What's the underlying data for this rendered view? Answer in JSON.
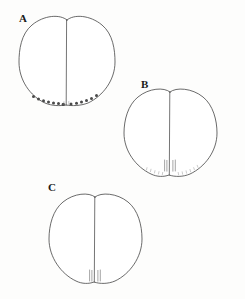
{
  "figure": {
    "background_color": "#fdfdfc",
    "line_color": "#3a3a3a",
    "dot_color": "#4a4a4a",
    "faint_color": "#9a9a9a",
    "width": 245,
    "height": 299,
    "panels": [
      {
        "id": "A",
        "label": "A",
        "label_x": 19,
        "label_y": 22,
        "center_x": 67,
        "center_y": 62,
        "radius_x": 48,
        "radius_y": 47,
        "top_notch_depth": 7,
        "midline_top_y": 20,
        "midline_bottom_y": 105,
        "feature_type": "dots",
        "feature_count": 13,
        "dots": [
          {
            "x": 33.5,
            "y": 96.5,
            "r": 1.5
          },
          {
            "x": 38.5,
            "y": 99.0,
            "r": 1.5
          },
          {
            "x": 43.5,
            "y": 100.5,
            "r": 1.5
          },
          {
            "x": 48.5,
            "y": 101.5,
            "r": 1.5
          },
          {
            "x": 53.5,
            "y": 102.5,
            "r": 1.5
          },
          {
            "x": 58.5,
            "y": 103.5,
            "r": 1.5
          },
          {
            "x": 63.5,
            "y": 104.5,
            "r": 1.7
          },
          {
            "x": 71.0,
            "y": 104.0,
            "r": 1.5
          },
          {
            "x": 76.5,
            "y": 103.0,
            "r": 1.5
          },
          {
            "x": 81.5,
            "y": 102.0,
            "r": 1.5
          },
          {
            "x": 86.5,
            "y": 100.5,
            "r": 1.5
          },
          {
            "x": 91.5,
            "y": 98.5,
            "r": 1.5
          },
          {
            "x": 96.5,
            "y": 95.5,
            "r": 1.5
          }
        ]
      },
      {
        "id": "B",
        "label": "B",
        "label_x": 141,
        "label_y": 88,
        "center_x": 170,
        "center_y": 133,
        "radius_x": 47,
        "radius_y": 45,
        "top_notch_depth": 6,
        "midline_top_y": 92,
        "midline_bottom_y": 175,
        "feature_type": "papillae-and-marginal-dots",
        "papillae_count": 4,
        "papillae": [
          {
            "x": 164.5,
            "y": 160.0,
            "h": 10.5
          },
          {
            "x": 167.0,
            "y": 160.5,
            "h": 10.5
          },
          {
            "x": 173.0,
            "y": 160.5,
            "h": 10.5
          },
          {
            "x": 175.5,
            "y": 160.0,
            "h": 10.5
          }
        ],
        "marginal_marks": [
          {
            "x": 146.0,
            "y": 170.5
          },
          {
            "x": 150.0,
            "y": 172.0
          },
          {
            "x": 154.0,
            "y": 173.5
          },
          {
            "x": 158.0,
            "y": 174.5
          },
          {
            "x": 162.0,
            "y": 175.0
          },
          {
            "x": 178.5,
            "y": 175.0
          },
          {
            "x": 182.5,
            "y": 174.5
          },
          {
            "x": 186.5,
            "y": 173.5
          },
          {
            "x": 190.5,
            "y": 172.0
          },
          {
            "x": 194.5,
            "y": 170.0
          },
          {
            "x": 198.5,
            "y": 168.0
          }
        ]
      },
      {
        "id": "C",
        "label": "C",
        "label_x": 48,
        "label_y": 191,
        "center_x": 95,
        "center_y": 239,
        "radius_x": 47,
        "radius_y": 46,
        "top_notch_depth": 6,
        "midline_top_y": 197,
        "midline_bottom_y": 282,
        "feature_type": "papillae",
        "papillae_count": 4,
        "papillae": [
          {
            "x": 89.5,
            "y": 270.0,
            "h": 11.0
          },
          {
            "x": 92.0,
            "y": 270.5,
            "h": 11.0
          },
          {
            "x": 98.0,
            "y": 270.5,
            "h": 11.0
          },
          {
            "x": 100.5,
            "y": 270.0,
            "h": 11.0
          }
        ]
      }
    ]
  }
}
